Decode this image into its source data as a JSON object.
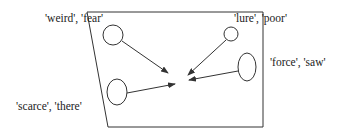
{
  "diagram": {
    "colors": {
      "stroke": "#333333",
      "text": "#222222",
      "background": "#ffffff"
    },
    "labels": {
      "top_left": "'weird', 'fear'",
      "top_right": "'lure', 'poor'",
      "right": "'force', 'saw'",
      "bottom_left": "'scarce', 'there'"
    },
    "nodes": [
      {
        "id": "top-left-circle",
        "label_ref": "top_left",
        "shape": "circle"
      },
      {
        "id": "bottom-left-ellipse",
        "label_ref": "bottom_left",
        "shape": "ellipse"
      },
      {
        "id": "top-right-circle",
        "label_ref": "top_right",
        "shape": "circle"
      },
      {
        "id": "right-ellipse",
        "label_ref": "right",
        "shape": "ellipse"
      }
    ],
    "arrows": [
      {
        "from": "top-left-circle",
        "to": "center"
      },
      {
        "from": "bottom-left-ellipse",
        "to": "center"
      },
      {
        "from": "top-right-circle",
        "to": "center"
      },
      {
        "from": "right-ellipse",
        "to": "center"
      }
    ]
  }
}
